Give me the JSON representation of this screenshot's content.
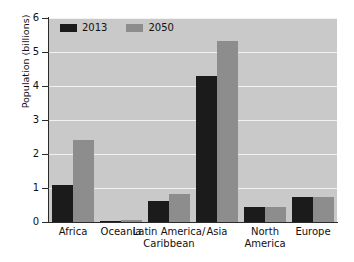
{
  "chart_data": {
    "type": "bar",
    "title": "",
    "xlabel": "",
    "ylabel": "Population (billions)",
    "ylim": [
      0,
      6
    ],
    "yticks": [
      "0",
      "1",
      "2",
      "3",
      "4",
      "5",
      "6"
    ],
    "grid": true,
    "legend_position": "top-left",
    "categories": [
      "Africa",
      "Oceania",
      "Latin America/\nCaribbean",
      "Asia",
      "North\nAmerica",
      "Europe"
    ],
    "series": [
      {
        "name": "2013",
        "color": "#1b1b1b",
        "values": [
          1.1,
          0.04,
          0.62,
          4.3,
          0.44,
          0.74
        ]
      },
      {
        "name": "2050",
        "color": "#8d8d8d",
        "values": [
          2.4,
          0.06,
          0.81,
          5.33,
          0.45,
          0.75
        ]
      }
    ]
  },
  "colors": {
    "plot_background": "#c9c9c9",
    "gridline": "#f2f2f2",
    "axis": "#2b2b2b",
    "page_background": "#ffffff",
    "text": "#111111"
  }
}
